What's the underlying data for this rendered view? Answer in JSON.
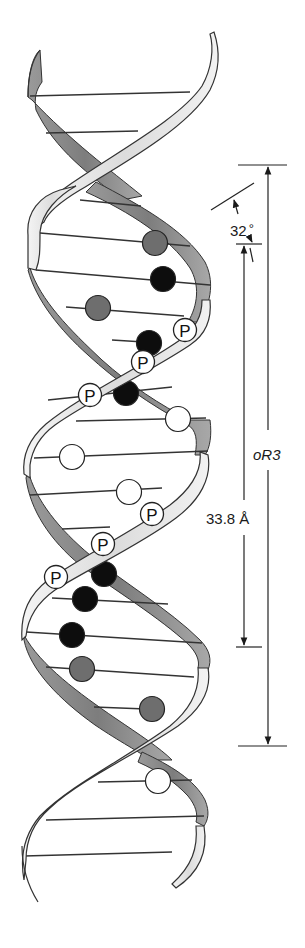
{
  "diagram": {
    "colors": {
      "front_strand": "#e6e6e6",
      "back_strand": "#8c8c8c",
      "outline": "#333333",
      "base_black": "#0d0d0d",
      "base_gray": "#6e6e6e",
      "base_white": "#ffffff",
      "rung": "#333333"
    },
    "annotations": {
      "angle_label": "32",
      "angle_unit": "°",
      "rise_label": "33.8 Å",
      "pitch_label": "oR3"
    },
    "phosphate_label": "P",
    "phosphates": [
      {
        "x": 185,
        "y": 330
      },
      {
        "x": 143,
        "y": 362
      },
      {
        "x": 90,
        "y": 395
      },
      {
        "x": 152,
        "y": 514
      },
      {
        "x": 103,
        "y": 544
      },
      {
        "x": 56,
        "y": 577
      }
    ],
    "bases": [
      {
        "x": 155,
        "y": 243,
        "type": "gray"
      },
      {
        "x": 163,
        "y": 279,
        "type": "black"
      },
      {
        "x": 98,
        "y": 308,
        "type": "gray"
      },
      {
        "x": 149,
        "y": 343,
        "type": "black"
      },
      {
        "x": 126,
        "y": 393,
        "type": "black"
      },
      {
        "x": 178,
        "y": 419,
        "type": "white"
      },
      {
        "x": 72,
        "y": 457,
        "type": "white"
      },
      {
        "x": 129,
        "y": 492,
        "type": "white"
      },
      {
        "x": 104,
        "y": 574,
        "type": "black"
      },
      {
        "x": 85,
        "y": 599,
        "type": "black"
      },
      {
        "x": 72,
        "y": 635,
        "type": "black"
      },
      {
        "x": 82,
        "y": 669,
        "type": "gray"
      },
      {
        "x": 152,
        "y": 709,
        "type": "gray"
      },
      {
        "x": 158,
        "y": 781,
        "type": "white"
      }
    ],
    "rungs": [
      {
        "x1": 30,
        "y1": 96,
        "x2": 190,
        "y2": 92
      },
      {
        "x1": 46,
        "y1": 133,
        "x2": 138,
        "y2": 131
      },
      {
        "x1": 80,
        "y1": 200,
        "x2": 141,
        "y2": 206
      },
      {
        "x1": 40,
        "y1": 233,
        "x2": 190,
        "y2": 246
      },
      {
        "x1": 36,
        "y1": 270,
        "x2": 210,
        "y2": 285
      },
      {
        "x1": 66,
        "y1": 307,
        "x2": 184,
        "y2": 316
      },
      {
        "x1": 112,
        "y1": 340,
        "x2": 160,
        "y2": 343
      },
      {
        "x1": 48,
        "y1": 400,
        "x2": 172,
        "y2": 387
      },
      {
        "x1": 76,
        "y1": 421,
        "x2": 206,
        "y2": 418
      },
      {
        "x1": 34,
        "y1": 458,
        "x2": 208,
        "y2": 451
      },
      {
        "x1": 30,
        "y1": 495,
        "x2": 162,
        "y2": 488
      },
      {
        "x1": 62,
        "y1": 529,
        "x2": 110,
        "y2": 527
      },
      {
        "x1": 52,
        "y1": 598,
        "x2": 168,
        "y2": 604
      },
      {
        "x1": 26,
        "y1": 632,
        "x2": 202,
        "y2": 643
      },
      {
        "x1": 46,
        "y1": 667,
        "x2": 194,
        "y2": 677
      },
      {
        "x1": 94,
        "y1": 707,
        "x2": 146,
        "y2": 709
      },
      {
        "x1": 98,
        "y1": 782,
        "x2": 192,
        "y2": 780
      },
      {
        "x1": 46,
        "y1": 820,
        "x2": 204,
        "y2": 816
      },
      {
        "x1": 24,
        "y1": 856,
        "x2": 172,
        "y2": 852
      }
    ]
  }
}
